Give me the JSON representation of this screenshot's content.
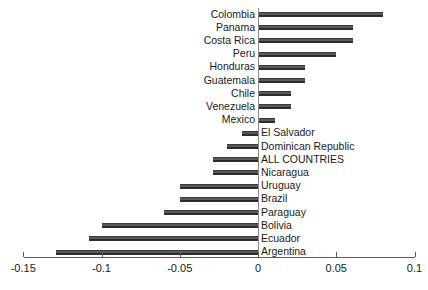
{
  "chart_data": {
    "type": "bar",
    "orientation": "horizontal",
    "title": "",
    "subtitle": "",
    "xlabel": "",
    "ylabel": "",
    "xlim": [
      -0.15,
      0.1
    ],
    "grid": false,
    "legend": null,
    "xticks": [
      -0.15,
      -0.1,
      -0.05,
      0,
      0.05,
      0.1
    ],
    "xtick_labels": [
      "-0.15",
      "-0.1",
      "-0.05",
      "0",
      "0.05",
      "0.1"
    ],
    "categories": [
      "Colombia",
      "Panama",
      "Costa Rica",
      "Peru",
      "Honduras",
      "Guatemala",
      "Chile",
      "Venezuela",
      "Mexico",
      "El Salvador",
      "Dominican Republic",
      "ALL COUNTRIES",
      "Nicaragua",
      "Uruguay",
      "Brazil",
      "Paraguay",
      "Bolivia",
      "Ecuador",
      "Argentina"
    ],
    "values": [
      0.08,
      0.061,
      0.061,
      0.05,
      0.03,
      0.03,
      0.021,
      0.021,
      0.011,
      -0.01,
      -0.02,
      -0.029,
      -0.029,
      -0.05,
      -0.05,
      -0.06,
      -0.1,
      -0.108,
      -0.129
    ],
    "bar_color": "#2b2b2b",
    "axis_color": "#5c5c5c"
  }
}
